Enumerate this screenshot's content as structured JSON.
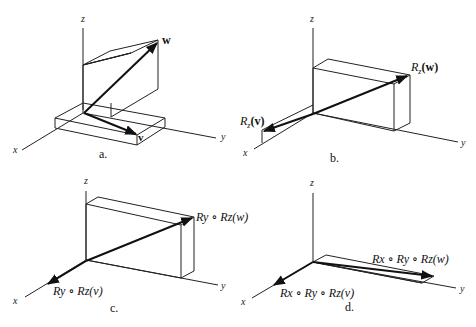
{
  "figure": {
    "panels": [
      {
        "id": "a",
        "caption": "a.",
        "axes": {
          "x": "x",
          "y": "y",
          "z": "z"
        },
        "vectors": [
          {
            "name": "w",
            "label": "w"
          },
          {
            "name": "v",
            "label": "v"
          }
        ]
      },
      {
        "id": "b",
        "caption": "b.",
        "axes": {
          "x": "x",
          "y": "y",
          "z": "z"
        },
        "vectors": [
          {
            "name": "Rz(w)",
            "label_R": "R",
            "label_sub": "z",
            "label_arg": "(w)"
          },
          {
            "name": "Rz(v)",
            "label_R": "R",
            "label_sub": "z",
            "label_arg": "(v)"
          }
        ]
      },
      {
        "id": "c",
        "caption": "c.",
        "axes": {
          "x": "x",
          "y": "y",
          "z": "z"
        },
        "vectors": [
          {
            "name": "Ry∘Rz(w)",
            "label": "Ry ∘ Rz(w)"
          },
          {
            "name": "Ry∘Rz(v)",
            "label": "Ry ∘ Rz(v)"
          }
        ]
      },
      {
        "id": "d",
        "caption": "d.",
        "axes": {
          "x": "x",
          "y": "y",
          "z": "z"
        },
        "vectors": [
          {
            "name": "Rx∘Ry∘Rz(w)",
            "label": "Rx ∘ Ry ∘ Rz(w)"
          },
          {
            "name": "Rx∘Ry∘Rz(v)",
            "label": "Rx ∘ Ry ∘ Rz(v)"
          }
        ]
      }
    ],
    "symbols": {
      "compose": "∘",
      "R": "R",
      "w": "w",
      "v": "v",
      "sub_x": "x",
      "sub_y": "y",
      "sub_z": "z",
      "lp": "(",
      "rp": ")"
    }
  }
}
